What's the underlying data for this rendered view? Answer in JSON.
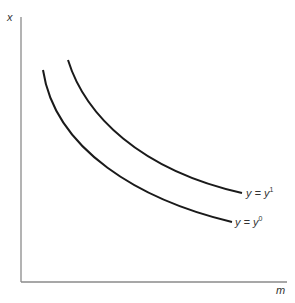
{
  "diagram": {
    "axes": {
      "y_label": "x",
      "x_label": "m"
    },
    "curves": [
      {
        "id": "y1",
        "label_base": "y = y",
        "label_sup": "1",
        "position": "outer"
      },
      {
        "id": "y0",
        "label_base": "y = y",
        "label_sup": "0",
        "position": "inner"
      }
    ],
    "colors": {
      "axis": "#8a8a8a",
      "curve": "#1a1a1a"
    }
  }
}
